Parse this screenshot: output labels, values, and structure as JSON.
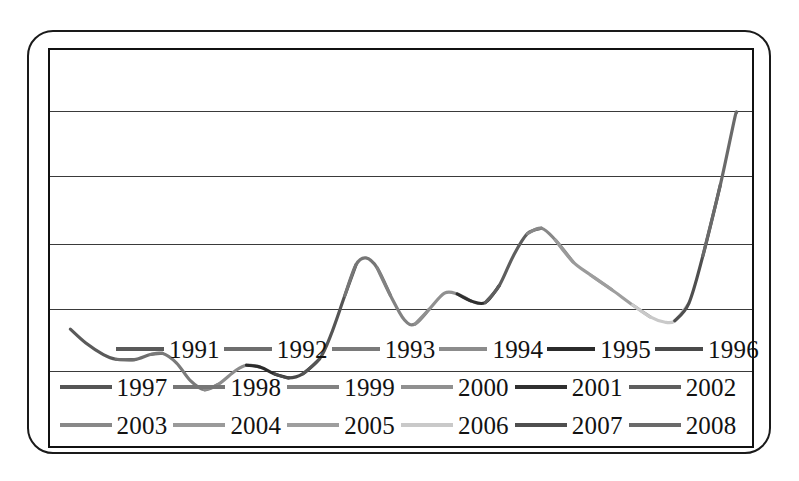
{
  "chart_data": {
    "type": "line",
    "title": "",
    "subtitle": "",
    "xlabel": "",
    "ylabel": "",
    "grid": true,
    "gridlines_y": 5,
    "legend_position": "bottom",
    "legend_columns": 6,
    "legend_rows": 3,
    "axis_tick_labels_x": [],
    "axis_tick_labels_y": [],
    "xlim": [
      0,
      100
    ],
    "ylim": [
      0,
      100
    ],
    "series": [
      {
        "name": "1991",
        "color": "#5a5a5a",
        "values": [
          {
            "x": 2.9,
            "y": 29.5
          },
          {
            "x": 5.1,
            "y": 26.0
          },
          {
            "x": 7.6,
            "y": 23.1
          },
          {
            "x": 9.4,
            "y": 21.9
          }
        ]
      },
      {
        "name": "1992",
        "color": "#6e6e6e",
        "values": [
          {
            "x": 9.4,
            "y": 21.9
          },
          {
            "x": 12.0,
            "y": 21.8
          },
          {
            "x": 14.3,
            "y": 23.1
          }
        ]
      },
      {
        "name": "1993",
        "color": "#7a7a7a",
        "values": [
          {
            "x": 14.3,
            "y": 23.1
          },
          {
            "x": 16.0,
            "y": 23.4
          },
          {
            "x": 18.0,
            "y": 21.0
          },
          {
            "x": 20.0,
            "y": 16.5
          },
          {
            "x": 22.0,
            "y": 14.2
          }
        ]
      },
      {
        "name": "1994",
        "color": "#8c8c8c",
        "values": [
          {
            "x": 22.0,
            "y": 14.2
          },
          {
            "x": 24.0,
            "y": 15.6
          },
          {
            "x": 26.4,
            "y": 19.0
          },
          {
            "x": 28.0,
            "y": 20.4
          }
        ]
      },
      {
        "name": "1995",
        "color": "#2b2b2b",
        "values": [
          {
            "x": 28.0,
            "y": 20.4
          },
          {
            "x": 30.0,
            "y": 19.9
          },
          {
            "x": 32.0,
            "y": 18.2
          }
        ]
      },
      {
        "name": "1996",
        "color": "#4a4a4a",
        "values": [
          {
            "x": 32.0,
            "y": 18.2
          },
          {
            "x": 34.0,
            "y": 17.2
          },
          {
            "x": 36.0,
            "y": 18.2
          }
        ]
      },
      {
        "name": "1997",
        "color": "#555555",
        "values": [
          {
            "x": 36.0,
            "y": 18.2
          },
          {
            "x": 38.4,
            "y": 22.0
          },
          {
            "x": 40.0,
            "y": 28.0
          },
          {
            "x": 42.0,
            "y": 38.0
          }
        ]
      },
      {
        "name": "1998",
        "color": "#767676",
        "values": [
          {
            "x": 42.0,
            "y": 38.0
          },
          {
            "x": 43.6,
            "y": 45.8
          },
          {
            "x": 45.0,
            "y": 47.5
          },
          {
            "x": 46.6,
            "y": 45.0
          }
        ]
      },
      {
        "name": "1999",
        "color": "#828282",
        "values": [
          {
            "x": 46.6,
            "y": 45.0
          },
          {
            "x": 48.5,
            "y": 38.0
          },
          {
            "x": 50.5,
            "y": 31.8
          },
          {
            "x": 52.0,
            "y": 30.8
          }
        ]
      },
      {
        "name": "2000",
        "color": "#909090",
        "values": [
          {
            "x": 52.0,
            "y": 30.8
          },
          {
            "x": 54.0,
            "y": 34.5
          },
          {
            "x": 56.2,
            "y": 38.6
          },
          {
            "x": 58.0,
            "y": 38.4
          }
        ]
      },
      {
        "name": "2001",
        "color": "#303030",
        "values": [
          {
            "x": 58.0,
            "y": 38.4
          },
          {
            "x": 60.0,
            "y": 36.6
          },
          {
            "x": 62.0,
            "y": 36.2
          }
        ]
      },
      {
        "name": "2002",
        "color": "#5e5e5e",
        "values": [
          {
            "x": 62.0,
            "y": 36.2
          },
          {
            "x": 64.0,
            "y": 40.5
          },
          {
            "x": 66.0,
            "y": 48.0
          },
          {
            "x": 68.0,
            "y": 53.6
          }
        ]
      },
      {
        "name": "2003",
        "color": "#888888",
        "values": [
          {
            "x": 68.0,
            "y": 53.6
          },
          {
            "x": 70.0,
            "y": 55.0
          },
          {
            "x": 72.0,
            "y": 52.0
          }
        ]
      },
      {
        "name": "2004",
        "color": "#9a9a9a",
        "values": [
          {
            "x": 72.0,
            "y": 52.0
          },
          {
            "x": 74.5,
            "y": 46.5
          },
          {
            "x": 77.0,
            "y": 43.2
          }
        ]
      },
      {
        "name": "2005",
        "color": "#9e9e9e",
        "values": [
          {
            "x": 77.0,
            "y": 43.2
          },
          {
            "x": 80.0,
            "y": 39.5
          },
          {
            "x": 83.0,
            "y": 35.6
          }
        ]
      },
      {
        "name": "2006",
        "color": "#c9c9c9",
        "values": [
          {
            "x": 83.0,
            "y": 35.6
          },
          {
            "x": 85.5,
            "y": 32.6
          },
          {
            "x": 87.5,
            "y": 31.3
          },
          {
            "x": 89.0,
            "y": 31.6
          }
        ]
      },
      {
        "name": "2007",
        "color": "#4f4f4f",
        "values": [
          {
            "x": 89.0,
            "y": 31.6
          },
          {
            "x": 91.0,
            "y": 36.0
          },
          {
            "x": 93.0,
            "y": 48.0
          }
        ]
      },
      {
        "name": "2008",
        "color": "#6a6a6a",
        "values": [
          {
            "x": 93.0,
            "y": 48.0
          },
          {
            "x": 95.5,
            "y": 66.0
          },
          {
            "x": 97.5,
            "y": 82.5
          },
          {
            "x": 97.8,
            "y": 84.2
          }
        ]
      }
    ]
  },
  "legend": {
    "rows": [
      [
        {
          "label": "1991",
          "color": "#5a5a5a"
        },
        {
          "label": "1992",
          "color": "#6e6e6e"
        },
        {
          "label": "1993",
          "color": "#7a7a7a"
        },
        {
          "label": "1994",
          "color": "#8c8c8c"
        },
        {
          "label": "1995",
          "color": "#2b2b2b"
        },
        {
          "label": "1996",
          "color": "#4a4a4a"
        }
      ],
      [
        {
          "label": "1997",
          "color": "#555555"
        },
        {
          "label": "1998",
          "color": "#767676"
        },
        {
          "label": "1999",
          "color": "#828282"
        },
        {
          "label": "2000",
          "color": "#909090"
        },
        {
          "label": "2001",
          "color": "#303030"
        },
        {
          "label": "2002",
          "color": "#5e5e5e"
        }
      ],
      [
        {
          "label": "2003",
          "color": "#888888"
        },
        {
          "label": "2004",
          "color": "#9a9a9a"
        },
        {
          "label": "2005",
          "color": "#9e9e9e"
        },
        {
          "label": "2006",
          "color": "#c9c9c9"
        },
        {
          "label": "2007",
          "color": "#4f4f4f"
        },
        {
          "label": "2008",
          "color": "#6a6a6a"
        }
      ]
    ]
  },
  "frame": {
    "outer_border_color": "#1a1a1a",
    "plot_border_color": "#111111",
    "gridline_color": "#3a3a3a",
    "background": "#ffffff"
  }
}
